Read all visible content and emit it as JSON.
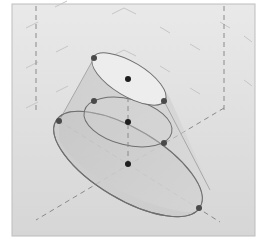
{
  "diagram": {
    "type": "3d-oblique-frustum",
    "frame": {
      "x": 12,
      "y": 4,
      "width": 243,
      "height": 232,
      "bg_top": "#e9e9e9",
      "bg_bottom": "#d6d6d6",
      "border": "#bdbdbd"
    },
    "colors": {
      "dash": "#8a8a8a",
      "grid_faint": "#c4c4c4",
      "surface": "#c8c8c8",
      "top_face": "#ededed",
      "outline": "#6f6f6f",
      "point": "#2a2a2a",
      "point_gray": "#4a4a4a"
    },
    "ellipses": [
      {
        "name": "bottom-base",
        "cx": 128,
        "cy": 164,
        "rx": 84,
        "ry": 35,
        "rotate": 31
      },
      {
        "name": "middle-section",
        "cx": 128,
        "cy": 122,
        "rx": 44,
        "ry": 23,
        "rotate": 14
      },
      {
        "name": "top-face",
        "cx": 128,
        "cy": 79,
        "rx": 42,
        "ry": 17,
        "rotate": 31
      }
    ],
    "points": [
      {
        "name": "top-left",
        "x": 94,
        "y": 58,
        "tone": "gray"
      },
      {
        "name": "top-center",
        "x": 128,
        "y": 79,
        "tone": "dark"
      },
      {
        "name": "top-right",
        "x": 164,
        "y": 101,
        "tone": "gray"
      },
      {
        "name": "middle-left",
        "x": 94,
        "y": 101,
        "tone": "gray"
      },
      {
        "name": "middle-center",
        "x": 128,
        "y": 122,
        "tone": "dark"
      },
      {
        "name": "middle-right",
        "x": 164,
        "y": 143,
        "tone": "gray"
      },
      {
        "name": "bottom-left",
        "x": 59,
        "y": 121,
        "tone": "gray"
      },
      {
        "name": "bottom-center",
        "x": 128,
        "y": 164,
        "tone": "dark"
      },
      {
        "name": "bottom-right",
        "x": 199,
        "y": 208,
        "tone": "gray"
      }
    ],
    "axis_lines": [
      {
        "name": "left-vertical",
        "x1": 36,
        "y1": 6,
        "x2": 36,
        "y2": 112
      },
      {
        "name": "right-vertical",
        "x1": 224,
        "y1": 6,
        "x2": 224,
        "y2": 110
      },
      {
        "name": "center-vertical",
        "x1": 128,
        "y1": 79,
        "x2": 128,
        "y2": 164
      },
      {
        "name": "diag-down-right",
        "x1": 59,
        "y1": 121,
        "x2": 220,
        "y2": 222
      },
      {
        "name": "diag-down-left",
        "x1": 224,
        "y1": 108,
        "x2": 36,
        "y2": 220
      }
    ]
  }
}
